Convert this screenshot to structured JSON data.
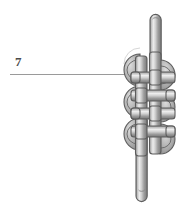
{
  "figure": {
    "type": "technical-line-drawing",
    "background_color": "#ffffff",
    "reference_callouts": [
      {
        "numeral": "7",
        "leader_line": {
          "orientation": "horizontal",
          "x_start": 10,
          "x_end": 126,
          "y": 74,
          "color": "#9a9a9a"
        },
        "label_position": {
          "x": 15,
          "y": 55
        },
        "label_color": "#4a4a4a",
        "points_to": "left edge of knot body"
      }
    ],
    "rope": {
      "stroke_color": "#5b5b5b",
      "highlight_color": "#f2f2f2",
      "midtone_color": "#b8b8b8",
      "shadow_color": "#6e6e6e",
      "width_px": 11,
      "top_end": {
        "x": 155,
        "y": 14,
        "cap": "rounded"
      },
      "bottom_end": {
        "x": 141,
        "y": 200,
        "cap": "rounded"
      }
    },
    "knot": {
      "style": "woven multi-bight decorative knot",
      "bounds": {
        "x": 120,
        "y": 46,
        "width": 62,
        "height": 116
      },
      "left_bights": 3,
      "right_bights": 3,
      "crossing_bars": 6,
      "shading": "cylindrical gradient with dark outline"
    }
  }
}
